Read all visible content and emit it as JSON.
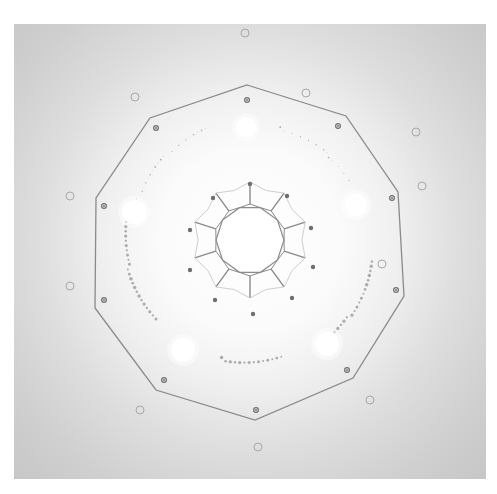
{
  "figure": {
    "colors": {
      "background": "#ffffff",
      "panel": "#cacaca",
      "line": "#8a8a8a",
      "dot": "#6e6e6e",
      "ring": "#a8a8a8",
      "bright_spot": "#ffffff"
    },
    "center": [
      250,
      240
    ],
    "center_disk_radius": 30,
    "outer_decagon": [
      [
        247,
        85
      ],
      [
        346,
        116
      ],
      [
        398,
        192
      ],
      [
        404,
        296
      ],
      [
        353,
        378
      ],
      [
        255,
        420
      ],
      [
        156,
        390
      ],
      [
        95,
        308
      ],
      [
        96,
        198
      ],
      [
        150,
        118
      ]
    ],
    "bright_spots": [
      [
        246,
        127,
        10
      ],
      [
        356,
        205,
        11
      ],
      [
        327,
        344,
        12
      ],
      [
        183,
        350,
        12
      ],
      [
        134,
        212,
        12
      ]
    ],
    "inner_dots": [
      [
        250,
        184
      ],
      [
        287,
        196
      ],
      [
        311,
        228
      ],
      [
        313,
        267
      ],
      [
        292,
        298
      ],
      [
        253,
        314
      ],
      [
        215,
        300
      ],
      [
        190,
        270
      ],
      [
        190,
        230
      ],
      [
        213,
        198
      ]
    ],
    "vertex_dots": [
      [
        247,
        100
      ],
      [
        338,
        126
      ],
      [
        392,
        198
      ],
      [
        396,
        290
      ],
      [
        347,
        370
      ],
      [
        256,
        410
      ],
      [
        164,
        380
      ],
      [
        104,
        300
      ],
      [
        104,
        206
      ],
      [
        156,
        128
      ]
    ],
    "outer_rings": [
      [
        245,
        33
      ],
      [
        416,
        132
      ],
      [
        422,
        186
      ],
      [
        382,
        264
      ],
      [
        370,
        400
      ],
      [
        258,
        447
      ],
      [
        140,
        410
      ],
      [
        70,
        286
      ],
      [
        70,
        196
      ],
      [
        135,
        97
      ],
      [
        306,
        93
      ]
    ],
    "glyph_arcs": [
      {
        "cx": 250,
        "cy": 240,
        "r": 122,
        "start": -160,
        "end": -110
      },
      {
        "cx": 250,
        "cy": 240,
        "r": 118,
        "start": -75,
        "end": -30
      },
      {
        "cx": 250,
        "cy": 240,
        "r": 125,
        "start": 10,
        "end": 55
      },
      {
        "cx": 250,
        "cy": 240,
        "r": 122,
        "start": 75,
        "end": 105
      },
      {
        "cx": 250,
        "cy": 240,
        "r": 124,
        "start": 140,
        "end": 190
      }
    ]
  }
}
